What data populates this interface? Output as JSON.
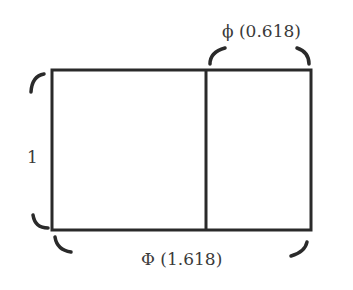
{
  "diagram": {
    "type": "golden-rectangle",
    "colors": {
      "stroke": "#2a2a2a",
      "text": "#3a3a3a",
      "background": "#ffffff"
    },
    "labels": {
      "top": "ϕ (0.618)",
      "left": "1",
      "bottom": "Φ (1.618)"
    },
    "geometry": {
      "rect": {
        "x": 52,
        "y": 70,
        "width": 259,
        "height": 160
      },
      "divider_x": 206
    }
  }
}
